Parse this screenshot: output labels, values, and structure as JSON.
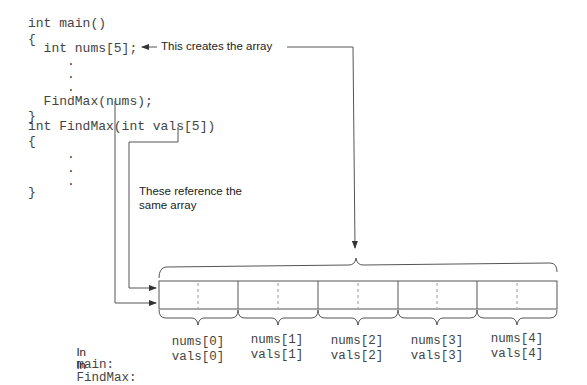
{
  "code": {
    "lines": [
      "int main()",
      "{",
      "  int nums[5];",
      "     .",
      "     .",
      "     .",
      "  FindMax(nums);",
      "}",
      "int FindMax(int vals[5])",
      "{",
      "     .",
      "     .",
      "     .",
      "}"
    ]
  },
  "annotations": {
    "creates_array": "This creates the array",
    "same_array_line1": "These reference the",
    "same_array_line2": "same array"
  },
  "legend": {
    "main_prefix": "In",
    "main_name": "main:",
    "findmax_prefix": "In",
    "findmax_name": "FindMax:"
  },
  "array": {
    "size": 5,
    "cells": [
      {
        "main": "nums[0]",
        "findmax": "vals[0]"
      },
      {
        "main": "nums[1]",
        "findmax": "vals[1]"
      },
      {
        "main": "nums[2]",
        "findmax": "vals[2]"
      },
      {
        "main": "nums[3]",
        "findmax": "vals[3]"
      },
      {
        "main": "nums[4]",
        "findmax": "vals[4]"
      }
    ]
  },
  "colors": {
    "line": "#555555",
    "text": "#222222",
    "code": "#444444"
  }
}
